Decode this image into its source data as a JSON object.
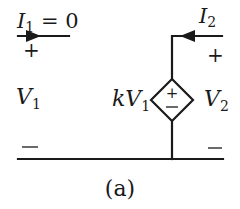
{
  "figure": {
    "caption": "(a)",
    "type": "circuit-schematic"
  },
  "port1": {
    "current_label_main": "I",
    "current_label_sub": "1",
    "current_label_rest": " = 0",
    "plus": "+",
    "minus": "−",
    "voltage_label_main": "V",
    "voltage_label_sub": "1"
  },
  "port2": {
    "current_label_main": "I",
    "current_label_sub": "2",
    "plus": "+",
    "minus": "−",
    "voltage_label_main": "V",
    "voltage_label_sub": "2"
  },
  "dependent_source": {
    "kind": "voltage-controlled voltage source",
    "gain_label_prefix": "kV",
    "gain_label_sub": "1",
    "plus": "+",
    "minus": "−"
  },
  "colors": {
    "ink": "#1a1a1a",
    "background": "#ffffff"
  }
}
